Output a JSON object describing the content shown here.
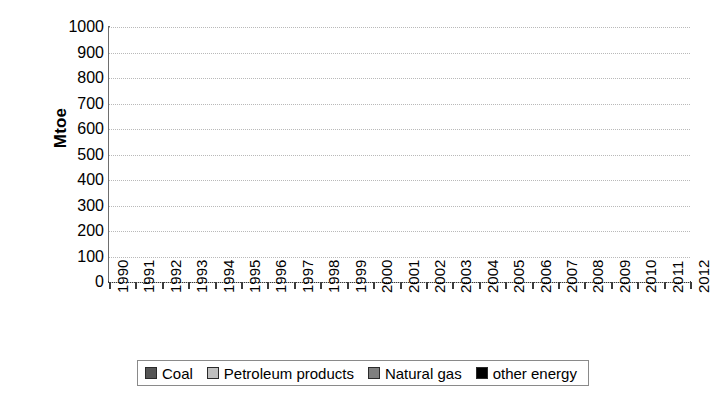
{
  "chart_data": {
    "type": "area",
    "stacked": true,
    "title": "",
    "xlabel": "",
    "ylabel": "Mtoe",
    "ylim": [
      0,
      1000
    ],
    "ytick_step": 100,
    "yticks": [
      0,
      100,
      200,
      300,
      400,
      500,
      600,
      700,
      800,
      900,
      1000
    ],
    "ytick_labels": [
      "0",
      "100",
      "200",
      "300",
      "400",
      "500",
      "600",
      "700",
      "800",
      "900",
      "1000"
    ],
    "grid": true,
    "grid_axis": "y",
    "legend_position": "bottom",
    "categories": [
      "1990",
      "1991",
      "1992",
      "1993",
      "1994",
      "1995",
      "1996",
      "1997",
      "1998",
      "1999",
      "2000",
      "2001",
      "2002",
      "2003",
      "2004",
      "2005",
      "2006",
      "2007",
      "2008",
      "2009",
      "2010",
      "2011",
      "2012"
    ],
    "series": [
      {
        "name": "Coal",
        "color": "#555555",
        "values": [
          125,
          122,
          120,
          120,
          123,
          127,
          132,
          133,
          138,
          140,
          148,
          157,
          167,
          180,
          196,
          213,
          231,
          248,
          263,
          272,
          296,
          316,
          335
        ]
      },
      {
        "name": "Petroleum products",
        "color": "#bfbfbf",
        "values": [
          75,
          76,
          78,
          79,
          82,
          84,
          87,
          92,
          98,
          106,
          111,
          116,
          120,
          126,
          132,
          138,
          144,
          151,
          157,
          163,
          173,
          183,
          193
        ]
      },
      {
        "name": "Natural gas",
        "color": "#7f7f7f",
        "values": [
          25,
          26,
          27,
          27,
          28,
          30,
          32,
          34,
          36,
          38,
          40,
          42,
          45,
          48,
          52,
          56,
          60,
          65,
          70,
          76,
          85,
          95,
          105
        ]
      },
      {
        "name": "other energy",
        "color": "#000000",
        "values": [
          160,
          166,
          170,
          176,
          182,
          187,
          192,
          196,
          199,
          206,
          216,
          222,
          228,
          240,
          253,
          264,
          280,
          291,
          298,
          303,
          311,
          299,
          289
        ]
      }
    ],
    "totals": [
      385,
      390,
      395,
      402,
      415,
      428,
      443,
      455,
      471,
      490,
      515,
      537,
      560,
      594,
      633,
      671,
      715,
      755,
      788,
      814,
      865,
      893,
      922
    ]
  },
  "legend": {
    "items": [
      {
        "label": "Coal",
        "swatch_name": "legend-swatch-coal"
      },
      {
        "label": "Petroleum products",
        "swatch_name": "legend-swatch-petroleum-products"
      },
      {
        "label": "Natural gas",
        "swatch_name": "legend-swatch-natural-gas"
      },
      {
        "label": "other energy",
        "swatch_name": "legend-swatch-other-energy"
      }
    ]
  }
}
